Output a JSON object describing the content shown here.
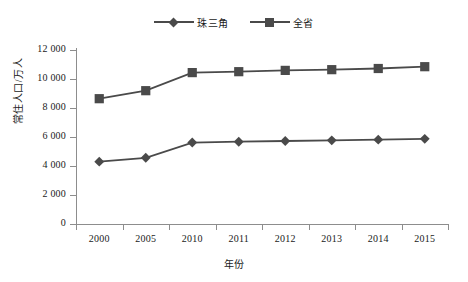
{
  "chart_data": {
    "type": "line",
    "title": "",
    "xlabel": "年份",
    "ylabel": "常住人口/万人",
    "categories": [
      "2000",
      "2005",
      "2010",
      "2011",
      "2012",
      "2013",
      "2014",
      "2015"
    ],
    "ylim": [
      0,
      12000
    ],
    "ytick_labels": [
      "0",
      "2 000",
      "4 000",
      "6 000",
      "8 000",
      "10 000",
      "12 000"
    ],
    "ytick_values": [
      0,
      2000,
      4000,
      6000,
      8000,
      10000,
      12000
    ],
    "grid": false,
    "legend_position": "top-center",
    "series": [
      {
        "name": "珠三角",
        "marker": "diamond",
        "color": "#4a4a4a",
        "values": [
          4300,
          4566,
          5617,
          5674,
          5725,
          5768,
          5818,
          5874
        ]
      },
      {
        "name": "全省",
        "marker": "square",
        "color": "#4a4a4a",
        "values": [
          8642,
          9194,
          10441,
          10505,
          10594,
          10644,
          10724,
          10849
        ]
      }
    ]
  },
  "legend": {
    "items": [
      {
        "label": "珠三角",
        "marker": "diamond"
      },
      {
        "label": "全省",
        "marker": "square"
      }
    ]
  },
  "axes": {
    "y_label": "常住人口/万人",
    "x_label": "年份"
  },
  "colors": {
    "series": "#4a4a4a",
    "axis": "#8d8d8d",
    "background": "#ffffff",
    "text": "#1a1a1a"
  }
}
